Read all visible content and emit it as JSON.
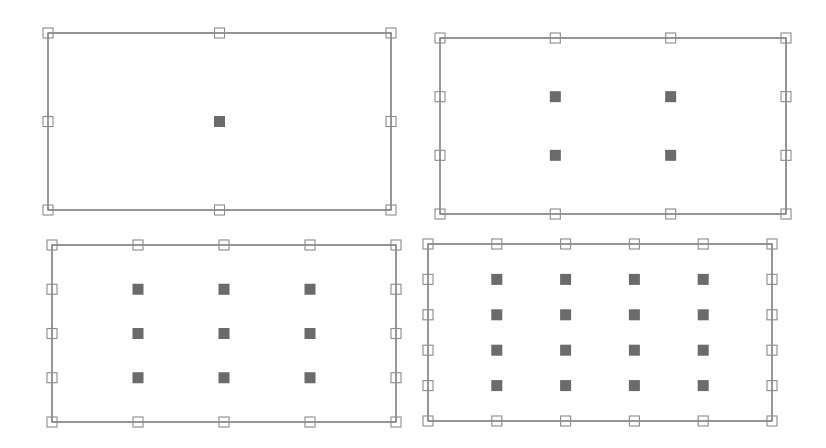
{
  "diagram": {
    "colors": {
      "frame": "#6a6a6a",
      "handle_stroke": "#8c8c8c",
      "interior_point": "#6b6b6b",
      "background": "#ffffff"
    },
    "handle_size": 10,
    "point_size": 11,
    "panels": [
      {
        "id": "panel-1x1",
        "rect": {
          "x1": 48,
          "y1": 33,
          "x2": 391,
          "y2": 210
        },
        "border_handles": {
          "cols": 3,
          "rows": 3
        },
        "interior_grid": {
          "cols": 1,
          "rows": 1
        }
      },
      {
        "id": "panel-2x2",
        "rect": {
          "x1": 440,
          "y1": 38,
          "x2": 786,
          "y2": 214
        },
        "border_handles": {
          "cols": 4,
          "rows": 4
        },
        "interior_grid": {
          "cols": 2,
          "rows": 2
        }
      },
      {
        "id": "panel-3x3",
        "rect": {
          "x1": 52,
          "y1": 245,
          "x2": 396,
          "y2": 422
        },
        "border_handles": {
          "cols": 5,
          "rows": 5
        },
        "interior_grid": {
          "cols": 3,
          "rows": 3
        }
      },
      {
        "id": "panel-4x4",
        "rect": {
          "x1": 428,
          "y1": 244,
          "x2": 772,
          "y2": 421
        },
        "border_handles": {
          "cols": 6,
          "rows": 6
        },
        "interior_grid": {
          "cols": 4,
          "rows": 4
        }
      }
    ]
  }
}
